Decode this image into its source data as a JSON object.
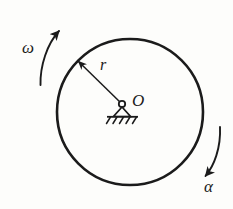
{
  "figure": {
    "type": "mechanics-free-body-diagram",
    "background_color": "#fdfdfb",
    "ink_color": "#1b1b1b"
  },
  "labels": {
    "angular_velocity": "ω",
    "angular_acceleration": "α",
    "radius": "r",
    "center": "O"
  },
  "geometry": {
    "circle": {
      "center_x": 130,
      "center_y": 112,
      "radius": 73,
      "stroke_width": 2.6
    },
    "pin_support": {
      "x": 122,
      "y": 104,
      "hinge_radius": 3.2,
      "triangle_half_width": 8,
      "triangle_height": 11,
      "ground_line_width": 30,
      "hatch_count": 5
    },
    "radius_arrow": {
      "from_x": 122,
      "from_y": 104,
      "to_x": 76,
      "to_y": 59,
      "stroke_width": 1.4
    },
    "omega_arc": {
      "start_x": 40,
      "start_y": 84,
      "end_x": 61,
      "end_y": 30,
      "direction": "counterclockwise-upward",
      "stroke_width": 1.9
    },
    "alpha_arc": {
      "start_x": 219,
      "start_y": 128,
      "end_x": 203,
      "end_y": 179,
      "direction": "clockwise-downward",
      "stroke_width": 1.9
    }
  }
}
